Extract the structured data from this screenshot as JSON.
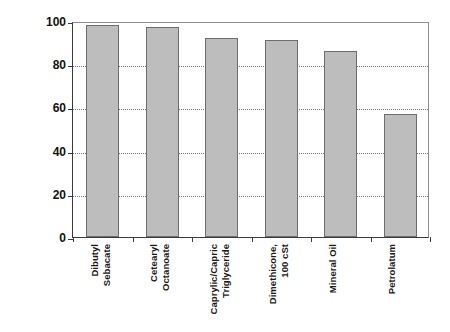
{
  "chart_data": {
    "type": "bar",
    "title": "",
    "xlabel": "",
    "ylabel": "Percent of initial TEWL",
    "ylim": [
      0,
      100
    ],
    "yticks": [
      0,
      20,
      40,
      60,
      80,
      100
    ],
    "ytick_labels": [
      "0",
      "20",
      "40",
      "60",
      "80",
      "100"
    ],
    "grid": "horizontal dotted at 20, 40, 60, 80",
    "legend": "none",
    "bar_color": "#bdbdbd",
    "bar_edge_color": "#6d6d6d",
    "axis_color": "#3b3b3b",
    "gridline_color": "#6f6f99",
    "categories": [
      "Dibutyl\nSebacate",
      "Cetearyl\nOctanoate",
      "Caprylic/Capric\nTriglyceride",
      "Dimethicone,\n100 cSt",
      "Mineral Oil",
      "Petrolatum"
    ],
    "values": [
      98,
      97,
      92,
      91,
      86,
      57
    ]
  }
}
